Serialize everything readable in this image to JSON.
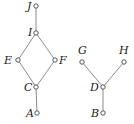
{
  "diagram": {
    "type": "hasse-diagram",
    "colors": {
      "edge": "#8a8a8a",
      "node_stroke": "#555555",
      "label": "#1a1a1a"
    },
    "nodes": [
      {
        "id": "J",
        "label": "J",
        "x": 36,
        "y": 6,
        "lx": 27,
        "ly": 10,
        "anchor": "start"
      },
      {
        "id": "I",
        "label": "I",
        "x": 36,
        "y": 33,
        "lx": 28,
        "ly": 36,
        "anchor": "start"
      },
      {
        "id": "E",
        "label": "E",
        "x": 18,
        "y": 60,
        "lx": 4,
        "ly": 64,
        "anchor": "start"
      },
      {
        "id": "F",
        "label": "F",
        "x": 55,
        "y": 60,
        "lx": 59,
        "ly": 64,
        "anchor": "start"
      },
      {
        "id": "C",
        "label": "C",
        "x": 36,
        "y": 87,
        "lx": 24,
        "ly": 91,
        "anchor": "start"
      },
      {
        "id": "A",
        "label": "A",
        "x": 37,
        "y": 113,
        "lx": 26,
        "ly": 117,
        "anchor": "start"
      },
      {
        "id": "G",
        "label": "G",
        "x": 82,
        "y": 62,
        "lx": 78,
        "ly": 54,
        "anchor": "start"
      },
      {
        "id": "H",
        "label": "H",
        "x": 124,
        "y": 62,
        "lx": 119,
        "ly": 54,
        "anchor": "start"
      },
      {
        "id": "D",
        "label": "D",
        "x": 103,
        "y": 87,
        "lx": 90,
        "ly": 91,
        "anchor": "start"
      },
      {
        "id": "B",
        "label": "B",
        "x": 103,
        "y": 113,
        "lx": 91,
        "ly": 117,
        "anchor": "start"
      }
    ],
    "edges": [
      {
        "from": "J",
        "to": "I",
        "x1": 36,
        "y1": 6,
        "x2": 36,
        "y2": 33
      },
      {
        "from": "I",
        "to": "E",
        "x1": 36,
        "y1": 33,
        "x2": 18,
        "y2": 60
      },
      {
        "from": "I",
        "to": "F",
        "x1": 36,
        "y1": 33,
        "x2": 55,
        "y2": 60
      },
      {
        "from": "E",
        "to": "C",
        "x1": 18,
        "y1": 60,
        "x2": 36,
        "y2": 87
      },
      {
        "from": "F",
        "to": "C",
        "x1": 55,
        "y1": 60,
        "x2": 36,
        "y2": 87
      },
      {
        "from": "C",
        "to": "A",
        "x1": 36,
        "y1": 87,
        "x2": 37,
        "y2": 113
      },
      {
        "from": "G",
        "to": "D",
        "x1": 82,
        "y1": 62,
        "x2": 103,
        "y2": 87
      },
      {
        "from": "H",
        "to": "D",
        "x1": 124,
        "y1": 62,
        "x2": 103,
        "y2": 87
      },
      {
        "from": "D",
        "to": "B",
        "x1": 103,
        "y1": 87,
        "x2": 103,
        "y2": 113
      }
    ]
  }
}
